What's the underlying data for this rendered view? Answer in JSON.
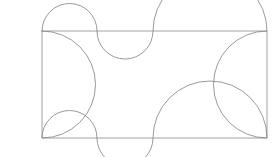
{
  "figure": {
    "canvas": {
      "width": 280,
      "height": 157,
      "background": "#ffffff"
    },
    "stroke": {
      "color": "#808080",
      "width": 0.8
    },
    "fill": "none"
  },
  "geometry": {
    "rectangle": {
      "left": 42,
      "top": 31,
      "right": 267,
      "bottom": 138,
      "width": 225,
      "height": 107
    },
    "top_edge_arcs": [
      {
        "name": "top-arc-1",
        "from_x": 42,
        "to_x": 97,
        "direction": "outward-up",
        "peak_y": 9
      },
      {
        "name": "top-arc-2",
        "from_x": 97,
        "to_x": 153,
        "direction": "inward-down",
        "peak_y": 53
      },
      {
        "name": "top-arc-3",
        "from_x": 153,
        "to_x": 267,
        "direction": "outward-up",
        "peak_y": 10
      }
    ],
    "bottom_edge_arcs": [
      {
        "name": "bottom-arc-1",
        "from_x": 42,
        "to_x": 97,
        "direction": "inward-up",
        "peak_y": 116
      },
      {
        "name": "bottom-arc-2",
        "from_x": 97,
        "to_x": 153,
        "direction": "outward-down",
        "peak_y": 151
      },
      {
        "name": "bottom-arc-3",
        "from_x": 153,
        "to_x": 267,
        "direction": "inward-up",
        "peak_y": 117
      }
    ],
    "left_edge_arc": {
      "name": "left-arc",
      "from_y": 31,
      "to_y": 138,
      "direction": "outward-left",
      "extreme_x": 9
    },
    "right_edge_arc": {
      "name": "right-arc",
      "from_y": 31,
      "to_y": 138,
      "direction": "inward-left",
      "extreme_x": 235
    }
  },
  "paths": {
    "outline": "M 42 31 A 27.5 27.5 0 0 1 97 31 A 28 28 0 0 0 153 31 A 57 57 0 0 1 267 31 A 53.5 53.5 0 0 0 267 138 A 57 57 0 0 0 153 138 A 28 28 0 0 1 97 138 A 27.5 27.5 0 0 0 42 138 A 53.5 53.5 0 0 0 42 31 Z",
    "rect_top": "M 42 31 L 267 31",
    "rect_bottom": "M 42 138 L 267 138",
    "rect_left": "M 42 31 L 42 138",
    "rect_right": "M 267 31 L 267 138"
  },
  "labels": {
    "none_visible": ""
  }
}
